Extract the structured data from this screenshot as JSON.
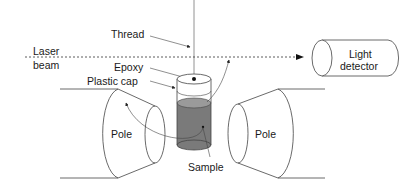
{
  "diagram": {
    "type": "schematic",
    "labels": {
      "thread": "Thread",
      "laser_line1": "Laser",
      "laser_line2": "beam",
      "epoxy": "Epoxy",
      "plastic_cap": "Plastic cap",
      "detector_line1": "Light",
      "detector_line2": "detector",
      "pole_left": "Pole",
      "pole_right": "Pole",
      "sample": "Sample"
    },
    "colors": {
      "line": "#444444",
      "sample_fill": "#7a7a7a",
      "sample_top": "#9a9a9a"
    }
  }
}
